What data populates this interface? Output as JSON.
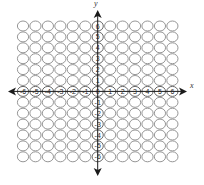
{
  "diagram": {
    "type": "coordinate-grid",
    "x_axis_label": "x",
    "y_axis_label": "y",
    "x_range": [
      -6,
      6
    ],
    "y_range": [
      -6,
      6
    ],
    "grid_rows": 13,
    "grid_cols": 13,
    "cell_shape": "circle",
    "x_tick_labels": [
      "-6",
      "-5",
      "-4",
      "-3",
      "-2",
      "-1",
      "0",
      "1",
      "2",
      "3",
      "4",
      "5",
      "6"
    ],
    "y_tick_labels": [
      "6",
      "5",
      "4",
      "3",
      "2",
      "1",
      "0",
      "-1",
      "-2",
      "-3",
      "-4",
      "-5",
      "-6"
    ],
    "origin_label": "0",
    "colors": {
      "circle_stroke": "#8a8a8a",
      "axis": "#1a1a1a",
      "label": "#2a2a2a",
      "background": "#ffffff"
    }
  }
}
